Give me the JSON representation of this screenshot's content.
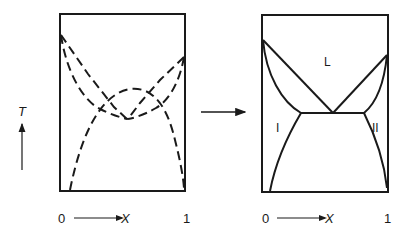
{
  "figure": {
    "colors": {
      "line": "#1a1a1a",
      "background": "#ffffff"
    }
  },
  "axis": {
    "temperature_label": "T",
    "composition_label": "X",
    "x_min_label": "0",
    "x_max_label": "1"
  },
  "left_panel": {
    "name": "Overlapping metastable phase boundaries (dashed)",
    "line_style": "dashed"
  },
  "transition_arrow": {
    "name": "arrow-right"
  },
  "right_panel": {
    "name": "Resulting eutectic phase diagram (solid)",
    "line_style": "solid",
    "regions": {
      "liquid": "L",
      "solid_1": "I",
      "solid_2": "II"
    }
  }
}
